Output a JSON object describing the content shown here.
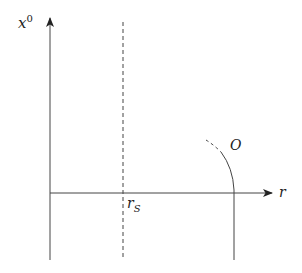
{
  "diagram": {
    "y_axis_label": "x",
    "y_axis_label_sup": "0",
    "x_axis_label": "r",
    "dashed_line_label": "r",
    "dashed_line_label_sub": "S",
    "worldline_label": "O",
    "line_color": "#333333"
  }
}
